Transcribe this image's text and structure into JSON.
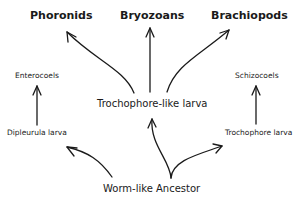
{
  "diagram": {
    "nodes": {
      "phoronids": "Phoronids",
      "bryozoans": "Bryozoans",
      "brachiopods": "Brachiopods",
      "enterocoels": "Enterocoels",
      "schizocoels": "Schizocoels",
      "trochophore_like_larva": "Trochophore-like larva",
      "dipleurula_larva": "Dipleurula larva",
      "trochophore_larva": "Trochophore larva",
      "worm_like_ancestor": "Worm-like Ancestor"
    },
    "edges": [
      {
        "from": "worm_like_ancestor",
        "to": "dipleurula_larva"
      },
      {
        "from": "worm_like_ancestor",
        "to": "trochophore_like_larva"
      },
      {
        "from": "worm_like_ancestor",
        "to": "trochophore_larva"
      },
      {
        "from": "dipleurula_larva",
        "to": "enterocoels"
      },
      {
        "from": "trochophore_larva",
        "to": "schizocoels"
      },
      {
        "from": "trochophore_like_larva",
        "to": "phoronids"
      },
      {
        "from": "trochophore_like_larva",
        "to": "bryozoans"
      },
      {
        "from": "trochophore_like_larva",
        "to": "brachiopods"
      }
    ]
  }
}
